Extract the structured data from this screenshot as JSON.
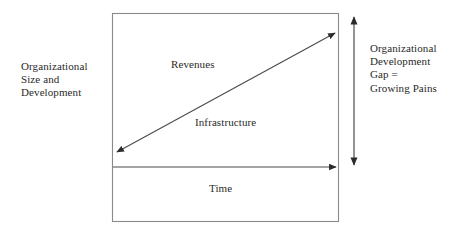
{
  "diagram": {
    "colors": {
      "box_stroke": "#8a8a8a",
      "arrow_stroke": "#3a3a3a",
      "text": "#2a2a2a",
      "background": "#ffffff"
    },
    "labels": {
      "y_axis": "Organizational\nSize and\nDevelopment",
      "gap": "Organizational\nDevelopment\nGap =\nGrowing Pains",
      "upper_region": "Revenues",
      "lower_region": "Infrastructure",
      "x_axis": "Time"
    },
    "arrows": {
      "diagonal": {
        "name": "growth-diagonal-arrow",
        "heads": "both",
        "from": [
          114,
          154
        ],
        "to": [
          338,
          31
        ]
      },
      "horizontal": {
        "name": "time-axis-arrow",
        "heads": "end",
        "from": [
          113,
          167
        ],
        "to": [
          339,
          167
        ]
      },
      "vertical_gap": {
        "name": "gap-measure-arrow",
        "heads": "both",
        "from": [
          354,
          14
        ],
        "to": [
          354,
          168
        ]
      }
    },
    "frame": {
      "name": "chart-frame",
      "x": 112,
      "y": 13,
      "width": 227,
      "height": 209
    }
  }
}
